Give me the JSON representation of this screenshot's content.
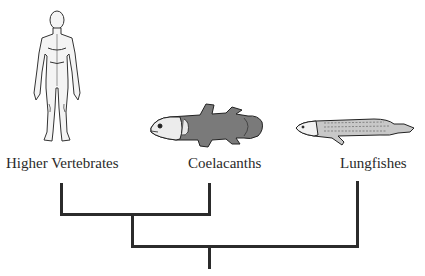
{
  "diagram": {
    "type": "cladogram",
    "taxa": [
      {
        "name": "Higher Vertebrates",
        "icon": "human-figure-icon"
      },
      {
        "name": "Coelacanths",
        "icon": "coelacanth-fish-icon"
      },
      {
        "name": "Lungfishes",
        "icon": "lungfish-icon"
      }
    ],
    "topology": "((Higher Vertebrates, Coelacanths), Lungfishes)",
    "line_color": "#2b2b2b"
  }
}
